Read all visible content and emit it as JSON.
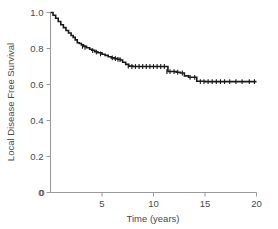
{
  "figure": {
    "name": "kaplan-meier-local-disease-free-survival",
    "background_color": "#ffffff",
    "curve_color": "#1a1a1a",
    "axis_color": "#9a9a9a",
    "text_color": "#4a4a4a"
  },
  "axes": {
    "x_title": "Time (years)",
    "y_title": "Local Disease Free Survival",
    "x_ticks": [
      "0",
      "5",
      "10",
      "15",
      "20"
    ],
    "x_tick_values": [
      0,
      5,
      10,
      15,
      20
    ],
    "y_ticks": [
      "0",
      "0.2",
      "0.4",
      "0.6",
      "0.8",
      "1.0"
    ],
    "y_tick_values": [
      0,
      0.2,
      0.4,
      0.6,
      0.8,
      1.0
    ]
  },
  "chart_data": {
    "type": "line",
    "title": "",
    "xlabel": "Time (years)",
    "ylabel": "Local Disease Free Survival",
    "xlim": [
      0,
      20
    ],
    "ylim": [
      0,
      1.0
    ],
    "grid": false,
    "legend": "none",
    "subtitle": "",
    "annotations": [],
    "series": [
      {
        "name": "Local Disease Free Survival",
        "style": "kaplan-meier-step",
        "x": [
          0.0,
          0.25,
          0.5,
          0.75,
          1.0,
          1.25,
          1.5,
          1.75,
          2.0,
          2.2,
          2.4,
          2.6,
          2.8,
          3.0,
          3.2,
          3.5,
          3.8,
          4.0,
          4.3,
          4.6,
          5.0,
          5.3,
          5.6,
          5.9,
          6.2,
          6.5,
          6.8,
          7.0,
          7.3,
          7.6,
          8.0,
          9.0,
          10.0,
          10.6,
          11.0,
          11.4,
          11.8,
          12.2,
          12.6,
          13.0,
          13.4,
          13.8,
          14.2,
          15.0,
          16.0,
          17.0,
          18.0,
          19.0,
          20.0
        ],
        "y": [
          1.0,
          0.985,
          0.968,
          0.95,
          0.932,
          0.916,
          0.9,
          0.886,
          0.872,
          0.862,
          0.848,
          0.832,
          0.828,
          0.82,
          0.812,
          0.804,
          0.796,
          0.79,
          0.782,
          0.776,
          0.768,
          0.762,
          0.754,
          0.748,
          0.744,
          0.74,
          0.736,
          0.724,
          0.712,
          0.702,
          0.7,
          0.7,
          0.7,
          0.7,
          0.7,
          0.672,
          0.672,
          0.668,
          0.664,
          0.648,
          0.64,
          0.64,
          0.618,
          0.616,
          0.616,
          0.616,
          0.616,
          0.616,
          0.616
        ]
      }
    ],
    "censored": {
      "description": "censoring tick marks on the survival curve",
      "x": [
        3.1,
        3.35,
        4.1,
        4.45,
        4.85,
        6.0,
        6.3,
        6.55,
        6.75,
        7.55,
        7.9,
        8.25,
        8.6,
        8.95,
        9.3,
        9.65,
        10.0,
        10.35,
        10.7,
        11.05,
        11.3,
        11.6,
        12.0,
        12.35,
        12.8,
        13.55,
        14.0,
        14.55,
        14.9,
        15.3,
        15.7,
        16.1,
        16.5,
        16.9,
        17.4,
        18.0,
        18.6,
        19.3,
        19.8
      ],
      "y": [
        0.812,
        0.806,
        0.788,
        0.78,
        0.77,
        0.748,
        0.744,
        0.74,
        0.738,
        0.702,
        0.7,
        0.7,
        0.7,
        0.7,
        0.7,
        0.7,
        0.7,
        0.7,
        0.7,
        0.7,
        0.672,
        0.672,
        0.672,
        0.668,
        0.664,
        0.64,
        0.64,
        0.616,
        0.616,
        0.616,
        0.616,
        0.616,
        0.616,
        0.616,
        0.616,
        0.616,
        0.616,
        0.616,
        0.616
      ]
    }
  }
}
